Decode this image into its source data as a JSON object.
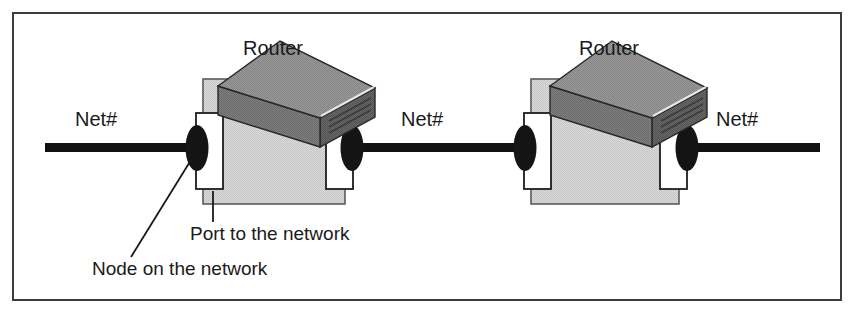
{
  "figure": {
    "type": "network-diagram",
    "width": 854,
    "height": 315,
    "background": "#ffffff",
    "frame": {
      "name": "figure-border",
      "stroke": "#3a3a3a",
      "fill": "#ffffff",
      "x": 12,
      "y": 12,
      "width": 830,
      "height": 289,
      "stroke_width": 2
    }
  },
  "colors": {
    "line_black": "#111111",
    "node_black": "#141414",
    "backdrop_gray": "#d3d3d3",
    "backdrop_border": "#555555",
    "box_top_gray": "#8f8f8f",
    "box_front_gray": "#787878",
    "box_side_gray": "#5f5f5f",
    "box_edge": "#2b2b2b",
    "port_white": "#ffffff",
    "port_border": "#1d1d1d",
    "text_dark": "#1a1a1a",
    "leader_line": "#1a1a1a"
  },
  "network_segments": [
    {
      "name": "segment-left",
      "label": "Net#",
      "x1": 45,
      "x2": 196,
      "y": 148
    },
    {
      "name": "segment-middle",
      "label": "Net#",
      "x1": 352,
      "x2": 532,
      "y": 148
    },
    {
      "name": "segment-right",
      "label": "Net#",
      "x1": 688,
      "x2": 820,
      "y": 148
    }
  ],
  "net_labels": [
    {
      "name": "net-label-left",
      "text": "Net#",
      "x": 75,
      "y": 126
    },
    {
      "name": "net-label-middle",
      "text": "Net#",
      "x": 401,
      "y": 126
    },
    {
      "name": "net-label-right",
      "text": "Net#",
      "x": 716,
      "y": 126
    }
  ],
  "routers": [
    {
      "name": "router-left",
      "label": "Router",
      "label_x": 273,
      "label_y": 55,
      "backdrop": {
        "x": 203,
        "y": 79,
        "width": 142,
        "height": 125
      },
      "ports": [
        {
          "name": "port-left",
          "x": 196,
          "y": 113,
          "width": 26,
          "height": 76
        },
        {
          "name": "port-right",
          "x": 327,
          "y": 113,
          "width": 26,
          "height": 76
        }
      ],
      "nodes": [
        {
          "name": "node-left",
          "cx": 197,
          "cy": 148,
          "rx": 11,
          "ry": 22
        },
        {
          "name": "node-right",
          "cx": 352,
          "cy": 148,
          "rx": 11,
          "ry": 22
        }
      ],
      "box": {
        "cx": 274,
        "cy": 110,
        "scale": 1.0
      }
    },
    {
      "name": "router-right",
      "label": "Router",
      "label_x": 609,
      "label_y": 55,
      "backdrop": {
        "x": 531,
        "y": 79,
        "width": 148,
        "height": 125
      },
      "ports": [
        {
          "name": "port-left",
          "x": 524,
          "y": 113,
          "width": 26,
          "height": 76
        },
        {
          "name": "port-right",
          "x": 661,
          "y": 113,
          "width": 26,
          "height": 76
        }
      ],
      "nodes": [
        {
          "name": "node-left",
          "cx": 525,
          "cy": 148,
          "rx": 11,
          "ry": 22
        },
        {
          "name": "node-right",
          "cx": 687,
          "cy": 148,
          "rx": 11,
          "ry": 22
        }
      ],
      "box": {
        "cx": 606,
        "cy": 110,
        "scale": 1.0
      }
    }
  ],
  "callouts": [
    {
      "name": "callout-port",
      "text": "Port to the network",
      "text_x": 190,
      "text_y": 240,
      "leader": {
        "x1": 213,
        "y1": 191,
        "x2": 213,
        "y2": 222
      }
    },
    {
      "name": "callout-node",
      "text": "Node on the network",
      "text_x": 92,
      "text_y": 275,
      "leader": {
        "x1": 191,
        "y1": 159,
        "x2": 131,
        "y2": 257
      }
    }
  ]
}
